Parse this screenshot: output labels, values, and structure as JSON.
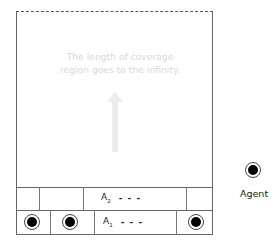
{
  "diagram": {
    "coverage_text_line1": "The length of coverage",
    "coverage_text_line2": "region goes to the infinity.",
    "arrow_direction": "up",
    "rows": [
      {
        "name": "A2",
        "label_main": "A",
        "label_sub": "2",
        "dashes": "- - -"
      },
      {
        "name": "A1",
        "label_main": "A",
        "label_sub": "1",
        "dashes": "- - -"
      }
    ],
    "agents_in_row_A1": 3,
    "legend": {
      "icon": "agent-icon",
      "label": "Agent"
    },
    "colors": {
      "border": "#666666",
      "dashed": "#555555",
      "faded_text": "#d9d9d9",
      "agent_fill": "#000000"
    }
  }
}
